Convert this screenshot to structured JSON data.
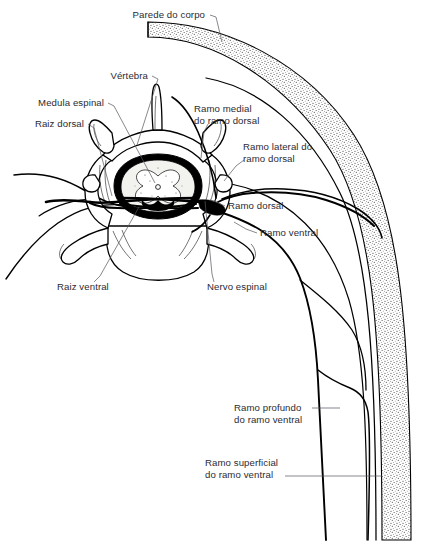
{
  "figure": {
    "kind": "anatomical-line-diagram",
    "language": "pt",
    "canvas": {
      "width": 433,
      "height": 557
    },
    "colors": {
      "background": "#ffffff",
      "ink": "#000000",
      "label_text": "#2b2b33",
      "leader_line": "#55555f",
      "body_wall_fill": "#f0f0ec",
      "spinal_cord_fill": "#f2f2ef",
      "gray_matter": "#000000"
    }
  },
  "labels": [
    {
      "id": "parede-do-corpo",
      "text": "Parede do corpo",
      "lines": [
        "Parede do corpo"
      ],
      "anchor": "end",
      "x": 205,
      "y": 18,
      "leader": "M 210 15 L 216 17 L 222 42"
    },
    {
      "id": "vertebra",
      "text": "Vértebra",
      "lines": [
        "Vértebra"
      ],
      "anchor": "end",
      "x": 148,
      "y": 79,
      "leader": "M 152 76 L 158 79 L 137 145"
    },
    {
      "id": "medula-espinal",
      "text": "Medula espinal",
      "lines": [
        "Medula espinal"
      ],
      "anchor": "end",
      "x": 104,
      "y": 106,
      "leader": "M 108 103 L 114 106 L 155 183"
    },
    {
      "id": "raiz-dorsal",
      "text": "Raiz dorsal",
      "lines": [
        "Raiz dorsal"
      ],
      "anchor": "end",
      "x": 84,
      "y": 127,
      "leader": "M 88 124 L 94 128 L 112 196"
    },
    {
      "id": "ramo-medial-do-ramo-dorsal",
      "text": "Ramo medial do ramo dorsal",
      "lines": [
        "Ramo medial",
        "do ramo dorsal"
      ],
      "anchor": "start",
      "x": 194,
      "y": 112,
      "leader": "M 208 122 L 203 130 L 201 158"
    },
    {
      "id": "ramo-lateral-do-ramo-dorsal",
      "text": "Ramo lateral do ramo dorsal",
      "lines": [
        "Ramo lateral do",
        "ramo dorsal"
      ],
      "anchor": "start",
      "x": 244,
      "y": 150,
      "leader": "M 244 160 L 236 166 L 222 182"
    },
    {
      "id": "ramo-dorsal",
      "text": "Ramo dorsal",
      "lines": [
        "Ramo dorsal"
      ],
      "anchor": "start",
      "x": 227,
      "y": 209,
      "leader": "M 225 206 L 218 202 L 212 199"
    },
    {
      "id": "ramo-ventral",
      "text": "Ramo ventral",
      "lines": [
        "Ramo ventral"
      ],
      "anchor": "start",
      "x": 259,
      "y": 236,
      "leader": "M 257 233 L 246 230 L 233 222"
    },
    {
      "id": "raiz-ventral",
      "text": "Raiz ventral",
      "lines": [
        "Raiz ventral"
      ],
      "anchor": "start",
      "x": 58,
      "y": 290,
      "leader": "M 92 282 L 99 276 L 139 206"
    },
    {
      "id": "nervo-espinal",
      "text": "Nervo espinal",
      "lines": [
        "Nervo espinal"
      ],
      "anchor": "start",
      "x": 206,
      "y": 290,
      "leader": "M 212 282 L 210 274 L 204 200"
    },
    {
      "id": "ramo-profundo-do-ramo-ventral",
      "text": "Ramo profundo do ramo ventral",
      "lines": [
        "Ramo profundo",
        "do ramo ventral"
      ],
      "anchor": "start",
      "x": 234,
      "y": 411,
      "leader": "M 312 408 L 338 408"
    },
    {
      "id": "ramo-superficial-do-ramo-ventral",
      "text": "Ramo superficial do ramo ventral",
      "lines": [
        "Ramo superficial",
        "do ramo ventral"
      ],
      "anchor": "start",
      "x": 205,
      "y": 466,
      "leader": "M 285 476 L 382 476"
    }
  ],
  "structures": [
    {
      "id": "body-wall",
      "name": "Parede do corpo",
      "description": "faixa pontilhada curva na margem direita"
    },
    {
      "id": "vertebra",
      "name": "Vértebra",
      "description": "corte transversal com processo espinhoso, lâminas e processos transversos"
    },
    {
      "id": "spinal-cord",
      "name": "Medula espinal",
      "description": "medula com substância cinzenta em borboleta no canal vertebral"
    },
    {
      "id": "dorsal-root",
      "name": "Raiz dorsal"
    },
    {
      "id": "ventral-root",
      "name": "Raiz ventral"
    },
    {
      "id": "spinal-nerve",
      "name": "Nervo espinal"
    },
    {
      "id": "dorsal-ramus",
      "name": "Ramo dorsal"
    },
    {
      "id": "medial-branch-dorsal-ramus",
      "name": "Ramo medial do ramo dorsal"
    },
    {
      "id": "lateral-branch-dorsal-ramus",
      "name": "Ramo lateral do ramo dorsal"
    },
    {
      "id": "ventral-ramus",
      "name": "Ramo ventral"
    },
    {
      "id": "deep-branch-ventral-ramus",
      "name": "Ramo profundo do ramo ventral"
    },
    {
      "id": "superficial-branch-ventral-ramus",
      "name": "Ramo superficial do ramo ventral"
    }
  ]
}
